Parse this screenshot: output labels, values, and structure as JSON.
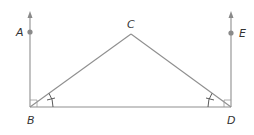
{
  "diagram": {
    "type": "geometry",
    "points": {
      "A": {
        "label": "A",
        "x": 30,
        "y": 32
      },
      "B": {
        "label": "B",
        "x": 30,
        "y": 107
      },
      "C": {
        "label": "C",
        "x": 131,
        "y": 34
      },
      "D": {
        "label": "D",
        "x": 231,
        "y": 107
      },
      "E": {
        "label": "E",
        "x": 231,
        "y": 33
      }
    },
    "segments": [
      {
        "from": "B",
        "to": "C"
      },
      {
        "from": "C",
        "to": "D"
      },
      {
        "from": "B",
        "to": "D"
      }
    ],
    "rays": [
      {
        "from": "B",
        "through": "A",
        "direction": "up"
      },
      {
        "from": "D",
        "through": "E",
        "direction": "up"
      }
    ],
    "right_angles": [
      "ABD",
      "EDB"
    ],
    "congruent_angles": [
      "CBD",
      "CDB"
    ],
    "colors": {
      "line": "#8f8f8f",
      "label": "#333333",
      "tick": "#5a5a5a"
    }
  }
}
